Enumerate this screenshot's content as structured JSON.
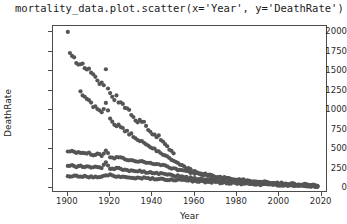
{
  "title": {
    "text": "mortality_data.plot.scatter(x='Year', y='DeathRate')"
  },
  "chart_data": {
    "type": "scatter",
    "title": "mortality_data.plot.scatter(x='Year', y='DeathRate')",
    "xlabel": "Year",
    "ylabel": "DeathRate",
    "xlim": [
      1893,
      2023
    ],
    "ylim": [
      -60,
      2080
    ],
    "grid": false,
    "legend": null,
    "marker": {
      "color": "#555555",
      "size": 3,
      "shape": "circle"
    },
    "xticks": [
      1900,
      1920,
      1940,
      1960,
      1980,
      2000,
      2020
    ],
    "yticks": [
      0,
      250,
      500,
      750,
      1000,
      1250,
      1500,
      1750,
      2000
    ],
    "series": [
      {
        "name": "high-rate-cause",
        "x": [
          1900,
          1901,
          1902,
          1903,
          1904,
          1905,
          1906,
          1907,
          1908,
          1909,
          1910,
          1911,
          1912,
          1913,
          1914,
          1915,
          1916,
          1917,
          1918,
          1919,
          1920,
          1921,
          1922,
          1923,
          1924,
          1925,
          1926,
          1927,
          1928,
          1929,
          1930,
          1931,
          1932,
          1933,
          1934,
          1935,
          1936,
          1937,
          1938,
          1939,
          1940,
          1941,
          1942,
          1943,
          1944,
          1945,
          1946,
          1947,
          1948,
          1949,
          1950
        ],
        "y": [
          1995,
          1720,
          1680,
          1660,
          1625,
          1600,
          1580,
          1600,
          1545,
          1520,
          1530,
          1470,
          1450,
          1430,
          1400,
          1360,
          1340,
          1330,
          1520,
          1280,
          1240,
          1180,
          1150,
          1170,
          1110,
          1090,
          1080,
          1020,
          1040,
          1000,
          960,
          930,
          890,
          860,
          855,
          830,
          840,
          790,
          740,
          720,
          700,
          690,
          660,
          670,
          620,
          590,
          560,
          540,
          500,
          470,
          450
        ]
      },
      {
        "name": "mid-band-upper",
        "x": [
          1900,
          1902,
          1904,
          1906,
          1908,
          1910,
          1912,
          1914,
          1916,
          1918,
          1920,
          1922,
          1924,
          1926,
          1928,
          1930,
          1932,
          1934,
          1936,
          1938,
          1940,
          1942,
          1944,
          1946,
          1948,
          1950,
          1952,
          1954,
          1956,
          1958,
          1960,
          1962,
          1964,
          1966,
          1968,
          1970,
          1972,
          1974,
          1976,
          1978,
          1980,
          1982,
          1984,
          1986,
          1988,
          1990,
          1992,
          1994,
          1996,
          1998,
          2000,
          2002,
          2004,
          2006,
          2008,
          2010,
          2012,
          2014,
          2016,
          2018
        ],
        "y": [
          470,
          480,
          455,
          460,
          440,
          450,
          430,
          445,
          420,
          490,
          400,
          390,
          405,
          380,
          370,
          360,
          350,
          345,
          340,
          330,
          320,
          310,
          300,
          290,
          270,
          255,
          240,
          225,
          215,
          205,
          195,
          185,
          175,
          168,
          160,
          152,
          144,
          136,
          128,
          120,
          115,
          108,
          102,
          96,
          92,
          88,
          83,
          79,
          75,
          71,
          67,
          63,
          60,
          57,
          54,
          51,
          48,
          46,
          44,
          42
        ]
      },
      {
        "name": "mid-band-lower",
        "x": [
          1900,
          1902,
          1904,
          1906,
          1908,
          1910,
          1912,
          1914,
          1916,
          1918,
          1920,
          1922,
          1924,
          1926,
          1928,
          1930,
          1932,
          1934,
          1936,
          1938,
          1940,
          1942,
          1944,
          1946,
          1948,
          1950,
          1952,
          1954,
          1956,
          1958,
          1960,
          1962,
          1964,
          1966,
          1968,
          1970,
          1972,
          1974,
          1976,
          1978,
          1980,
          1982,
          1984,
          1986,
          1988,
          1990,
          1992,
          1994,
          1996,
          1998,
          2000,
          2002,
          2004,
          2006,
          2008,
          2010,
          2012,
          2014,
          2016,
          2018
        ],
        "y": [
          290,
          300,
          280,
          295,
          275,
          285,
          268,
          278,
          262,
          330,
          255,
          248,
          258,
          240,
          235,
          228,
          222,
          218,
          212,
          206,
          200,
          194,
          188,
          180,
          172,
          164,
          156,
          148,
          140,
          133,
          126,
          120,
          114,
          108,
          103,
          98,
          93,
          88,
          83,
          79,
          75,
          71,
          67,
          64,
          60,
          57,
          54,
          51,
          48,
          46,
          43,
          41,
          38,
          36,
          34,
          32,
          30,
          29,
          27,
          26
        ]
      },
      {
        "name": "declining-cause-c",
        "x": [
          1906,
          1908,
          1910,
          1912,
          1914,
          1916,
          1918,
          1920,
          1922,
          1924,
          1926,
          1928,
          1930,
          1932,
          1934,
          1936,
          1938,
          1940,
          1942,
          1944,
          1946,
          1948,
          1950,
          1952,
          1954,
          1956,
          1958,
          1960,
          1965,
          1970,
          1975,
          1980,
          1985,
          1990,
          1995,
          2000,
          2005,
          2010,
          2015,
          2018
        ],
        "y": [
          1240,
          1180,
          1120,
          1060,
          1010,
          960,
          1100,
          880,
          830,
          800,
          760,
          720,
          680,
          640,
          610,
          580,
          545,
          515,
          485,
          455,
          420,
          385,
          350,
          320,
          290,
          262,
          238,
          215,
          180,
          150,
          125,
          105,
          88,
          74,
          62,
          52,
          44,
          37,
          31,
          28
        ]
      },
      {
        "name": "low-flat-cause",
        "x": [
          1900,
          1905,
          1910,
          1915,
          1920,
          1925,
          1930,
          1935,
          1940,
          1945,
          1950,
          1955,
          1960,
          1965,
          1970,
          1975,
          1980,
          1985,
          1990,
          1995,
          2000,
          2005,
          2010,
          2015,
          2018
        ],
        "y": [
          160,
          155,
          150,
          148,
          175,
          140,
          135,
          130,
          125,
          118,
          110,
          100,
          92,
          84,
          77,
          70,
          64,
          58,
          53,
          48,
          43,
          39,
          35,
          31,
          29
        ]
      }
    ]
  },
  "axes": {
    "ylabel": "DeathRate",
    "xlabel": "Year",
    "ytick_labels": [
      "0",
      "250",
      "500",
      "750",
      "1000",
      "1250",
      "1500",
      "1750",
      "2000"
    ],
    "xtick_labels": [
      "1900",
      "1920",
      "1940",
      "1960",
      "1980",
      "2000",
      "2020"
    ]
  }
}
